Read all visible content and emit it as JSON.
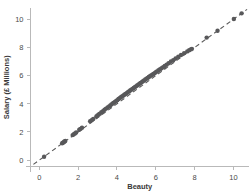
{
  "chart_data": {
    "type": "scatter",
    "title": "",
    "subtitle": "",
    "xlabel": "Beauty",
    "ylabel": "Salary (£ Millions)",
    "xlim": [
      -0.45,
      10.8
    ],
    "ylim": [
      -0.45,
      10.8
    ],
    "xticks": [
      0,
      2,
      4,
      6,
      8,
      10
    ],
    "yticks": [
      0,
      2,
      4,
      6,
      8,
      10
    ],
    "xtick_labels": [
      "0",
      "2",
      "4",
      "6",
      "8",
      "10"
    ],
    "ytick_labels": [
      "0",
      "2",
      "4",
      "6",
      "8",
      "10"
    ],
    "grid": false,
    "legend": null,
    "marker_color": "#58585a",
    "reference_line_color": "#5a5a5a",
    "axis_color": "#b9b9b9",
    "annotations": [],
    "series": [
      {
        "name": "Salary vs Beauty",
        "marker": "circle",
        "x": [
          0.25,
          1.18,
          1.22,
          1.26,
          1.3,
          1.34,
          1.72,
          1.78,
          1.84,
          1.9,
          2.06,
          2.12,
          2.2,
          2.62,
          2.7,
          2.78,
          2.94,
          3.0,
          3.06,
          3.12,
          3.2,
          3.28,
          3.36,
          3.44,
          3.52,
          3.6,
          3.66,
          3.72,
          3.78,
          3.84,
          3.9,
          3.96,
          4.02,
          4.08,
          4.14,
          4.2,
          4.26,
          4.32,
          4.38,
          4.44,
          4.5,
          4.56,
          4.62,
          4.68,
          4.74,
          4.8,
          4.86,
          4.92,
          4.98,
          5.04,
          5.1,
          5.16,
          5.22,
          5.28,
          5.34,
          5.4,
          5.46,
          5.52,
          5.58,
          5.64,
          5.7,
          5.76,
          5.82,
          5.88,
          5.94,
          6.0,
          6.06,
          6.14,
          6.22,
          6.3,
          6.38,
          6.46,
          6.56,
          6.66,
          6.78,
          6.9,
          7.02,
          7.16,
          7.3,
          7.46,
          7.62,
          7.72,
          7.8,
          7.86,
          8.62,
          9.18,
          10.02,
          10.42
        ],
        "y": [
          0.24,
          1.2,
          1.24,
          1.28,
          1.32,
          1.36,
          1.78,
          1.84,
          1.9,
          1.96,
          2.16,
          2.22,
          2.3,
          2.76,
          2.84,
          2.92,
          3.1,
          3.18,
          3.24,
          3.3,
          3.4,
          3.48,
          3.58,
          3.66,
          3.74,
          3.82,
          3.88,
          3.96,
          4.02,
          4.08,
          4.14,
          4.2,
          4.26,
          4.34,
          4.4,
          4.46,
          4.52,
          4.58,
          4.64,
          4.7,
          4.76,
          4.82,
          4.88,
          4.94,
          5.0,
          5.06,
          5.12,
          5.18,
          5.24,
          5.3,
          5.36,
          5.42,
          5.48,
          5.54,
          5.6,
          5.66,
          5.72,
          5.78,
          5.84,
          5.9,
          5.96,
          6.02,
          6.06,
          6.12,
          6.18,
          6.24,
          6.3,
          6.38,
          6.46,
          6.52,
          6.6,
          6.68,
          6.78,
          6.88,
          7.0,
          7.1,
          7.22,
          7.34,
          7.46,
          7.6,
          7.72,
          7.8,
          7.86,
          7.9,
          8.7,
          9.18,
          10.02,
          10.42
        ]
      }
    ],
    "reference_line": {
      "name": "identity-line",
      "style": "dashed",
      "from": [
        -0.3,
        -0.3
      ],
      "to": [
        10.7,
        10.7
      ]
    }
  }
}
